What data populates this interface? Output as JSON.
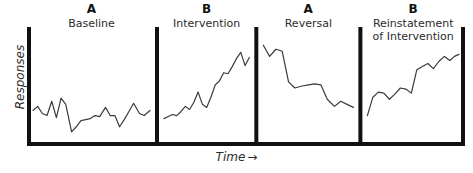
{
  "figure": {
    "title_present": false,
    "axes": {
      "y_label": "Responses",
      "x_label": "Time",
      "x_label_arrow": "→"
    },
    "style": {
      "line_color": "#3b3b3b",
      "axis_color": "#111111",
      "divider_color": "#111111",
      "background": "#ffffff",
      "axis_width_px": 4,
      "series_width_px": 1.2
    }
  },
  "phases": [
    {
      "letter": "A",
      "name": "Baseline",
      "name_lines": [
        "Baseline"
      ]
    },
    {
      "letter": "B",
      "name": "Intervention",
      "name_lines": [
        "Intervention"
      ]
    },
    {
      "letter": "A",
      "name": "Reversal",
      "name_lines": [
        "Reversal"
      ]
    },
    {
      "letter": "B",
      "name": "Reinstatement of Intervention",
      "name_lines": [
        "Reinstatement",
        "of Intervention"
      ]
    }
  ],
  "chart_data": {
    "type": "line",
    "title": "",
    "xlabel": "Time",
    "ylabel": "Responses",
    "grid": false,
    "legend": "none",
    "axis_ticks": "none",
    "design": "ABAB reversal design",
    "xlim": [
      0,
      100
    ],
    "ylim": [
      0,
      100
    ],
    "phase_boundaries_pct": [
      29.3,
      52.4,
      76.6
    ],
    "series": [
      {
        "name": "Baseline",
        "phase": "A",
        "x": [
          0,
          4,
          8,
          12,
          16,
          20,
          24,
          28,
          33,
          37,
          41,
          45,
          49,
          53,
          57,
          62,
          66,
          70,
          74,
          78,
          82,
          86,
          91,
          95,
          100
        ],
        "y": [
          27,
          31,
          24,
          22,
          36,
          20,
          39,
          33,
          6,
          11,
          17,
          18,
          19,
          22,
          21,
          30,
          22,
          22,
          11,
          18,
          26,
          34,
          24,
          22,
          27
        ]
      },
      {
        "name": "Intervention",
        "phase": "B",
        "x": [
          0,
          5,
          10,
          15,
          20,
          25,
          30,
          35,
          40,
          45,
          50,
          55,
          60,
          65,
          70,
          75,
          80,
          85,
          90,
          95,
          100
        ],
        "y": [
          19,
          21,
          23,
          22,
          26,
          31,
          28,
          35,
          45,
          33,
          30,
          40,
          52,
          56,
          64,
          63,
          70,
          78,
          84,
          71,
          79
        ]
      },
      {
        "name": "Reversal",
        "phase": "A",
        "x": [
          0,
          7,
          14,
          21,
          28,
          35,
          43,
          50,
          57,
          64,
          71,
          79,
          86,
          93,
          100
        ],
        "y": [
          91,
          80,
          87,
          85,
          55,
          49,
          51,
          52,
          53,
          52,
          38,
          31,
          36,
          33,
          30
        ]
      },
      {
        "name": "Reinstatement of Intervention",
        "phase": "B",
        "x": [
          0,
          6,
          12,
          18,
          24,
          30,
          36,
          42,
          48,
          54,
          60,
          66,
          72,
          78,
          84,
          90,
          95,
          100
        ],
        "y": [
          22,
          40,
          45,
          44,
          38,
          43,
          49,
          48,
          44,
          67,
          70,
          73,
          68,
          75,
          80,
          76,
          80,
          82
        ]
      }
    ]
  }
}
